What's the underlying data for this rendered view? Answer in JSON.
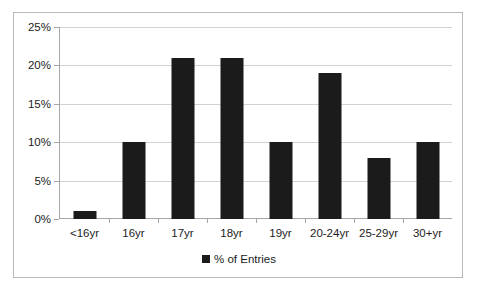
{
  "chart_data": {
    "type": "bar",
    "title": "",
    "xlabel": "",
    "ylabel": "",
    "categories": [
      "<16yr",
      "16yr",
      "17yr",
      "18yr",
      "19yr",
      "20-24yr",
      "25-29yr",
      "30+yr"
    ],
    "values": [
      1,
      10,
      21,
      21,
      10,
      19,
      8,
      10
    ],
    "series": [
      {
        "name": "% of Entries",
        "values": [
          1,
          10,
          21,
          21,
          10,
          19,
          8,
          10
        ]
      }
    ],
    "ylim": [
      0,
      25
    ],
    "ytick_values": [
      0,
      5,
      10,
      15,
      20,
      25
    ],
    "ytick_labels": [
      "0%",
      "5%",
      "10%",
      "15%",
      "20%",
      "25%"
    ],
    "grid": "horizontal",
    "legend_position": "bottom",
    "bar_color": "#1b1b1b",
    "gridline_color": "#d2d2d2",
    "axis_color": "#a6a6a6",
    "border_color": "#b9b9b9",
    "background_color": "#ffffff"
  },
  "legend": {
    "entries": [
      {
        "label": "% of Entries",
        "marker": "square-marker",
        "color": "#1b1b1b"
      }
    ]
  }
}
